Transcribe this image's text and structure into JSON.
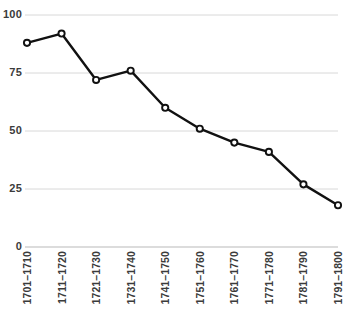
{
  "chart_data": {
    "type": "line",
    "title": "",
    "subtitle": "",
    "xlabel": "",
    "ylabel": "",
    "categories": [
      "1701–1710",
      "1711–1720",
      "1721–1730",
      "1731–1740",
      "1741–1750",
      "1751–1760",
      "1761–1770",
      "1771–1780",
      "1781–1790",
      "1791–1800"
    ],
    "values": [
      88,
      92,
      72,
      76,
      60,
      51,
      45,
      41,
      27,
      18
    ],
    "ylim": [
      0,
      100
    ],
    "yticks": [
      0,
      25,
      50,
      75,
      100
    ],
    "ytick_labels": [
      "0",
      "25",
      "50",
      "75",
      "100"
    ],
    "grid": true,
    "grid_axis": "y",
    "legend": false,
    "legend_position": "none",
    "series": [
      {
        "name": "",
        "values": [
          88,
          92,
          72,
          76,
          60,
          51,
          45,
          41,
          27,
          18
        ]
      }
    ],
    "marker": "open-circle",
    "colors": {
      "line": "#111111",
      "marker_fill": "#ffffff",
      "marker_stroke": "#111111",
      "grid": "#d8d8d8",
      "axis": "#b9b9b9",
      "tick_text": "#3b3b3b",
      "background": "#ffffff"
    }
  }
}
